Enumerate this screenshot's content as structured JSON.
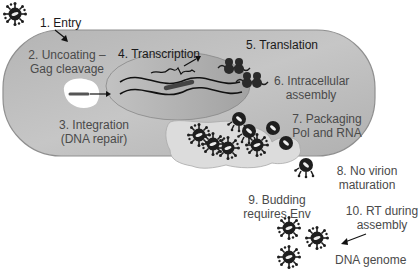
{
  "diagram": {
    "steps": [
      {
        "id": 1,
        "line1": "1. Entry",
        "line2": ""
      },
      {
        "id": 2,
        "line1": "2. Uncoating –",
        "line2": "Gag cleavage"
      },
      {
        "id": 3,
        "line1": "3. Integration",
        "line2": "(DNA repair)"
      },
      {
        "id": 4,
        "line1": "4. Transcription",
        "line2": ""
      },
      {
        "id": 5,
        "line1": "5. Translation",
        "line2": ""
      },
      {
        "id": 6,
        "line1": "6. Intracellular",
        "line2": "assembly"
      },
      {
        "id": 7,
        "line1": "7. Packaging",
        "line2": "Pol and RNA"
      },
      {
        "id": 8,
        "line1": "8. No virion",
        "line2": "maturation"
      },
      {
        "id": 9,
        "line1": "9. Budding",
        "line2": "requires Env"
      },
      {
        "id": 10,
        "line1": "10. RT during",
        "line2": "assembly"
      }
    ],
    "annotations": {
      "dna_genome": "DNA genome"
    },
    "colors": {
      "cell_fill": "#bdbdbd",
      "cell_stroke": "#8a8a8a",
      "nucleus_fill": "#a9a9a9",
      "vesicle_fill": "#dcdcdc",
      "virion": "#1e1e1e",
      "text": "#4a4a4a"
    }
  }
}
